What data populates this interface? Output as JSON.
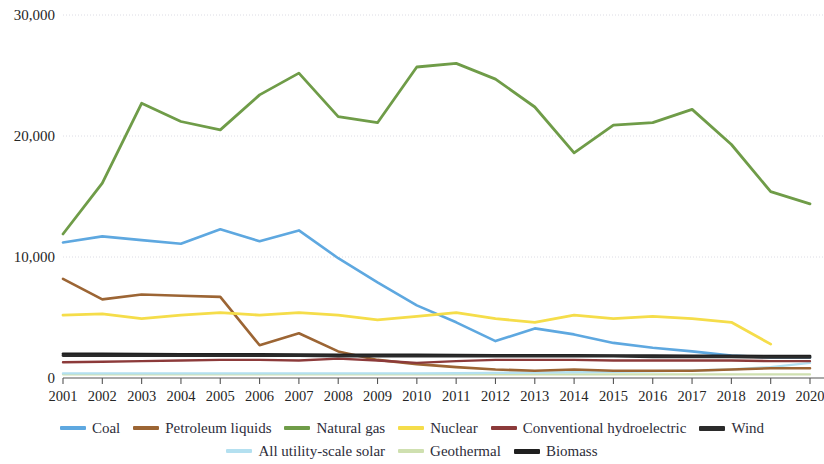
{
  "chart_data": {
    "type": "line",
    "title": "",
    "xlabel": "",
    "ylabel": "",
    "ylim": [
      0,
      30000
    ],
    "xlim": [
      "2001",
      "2020"
    ],
    "grid": true,
    "legend_position": "bottom",
    "y_ticks": [
      "0",
      "10,000",
      "20,000",
      "30,000"
    ],
    "y_tick_values": [
      0,
      10000,
      20000,
      30000
    ],
    "categories": [
      "2001",
      "2002",
      "2003",
      "2004",
      "2005",
      "2006",
      "2007",
      "2008",
      "2009",
      "2010",
      "2011",
      "2012",
      "2013",
      "2014",
      "2015",
      "2016",
      "2017",
      "2018",
      "2019",
      "2020"
    ],
    "series": [
      {
        "name": "Coal",
        "color": "#5ea8e0",
        "width": 2.6,
        "values": [
          11200,
          11700,
          11400,
          11100,
          12300,
          11300,
          12200,
          9900,
          7900,
          6000,
          4600,
          3050,
          4100,
          3600,
          2900,
          2500,
          2200,
          1850,
          1700,
          1700
        ]
      },
      {
        "name": "Petroleum liquids",
        "color": "#9c6534",
        "width": 2.6,
        "values": [
          8200,
          6500,
          6900,
          6800,
          6700,
          2700,
          3700,
          2200,
          1500,
          1150,
          900,
          700,
          600,
          700,
          600,
          600,
          600,
          700,
          800,
          800
        ]
      },
      {
        "name": "Natural gas",
        "color": "#6f9c48",
        "width": 2.8,
        "values": [
          11900,
          16100,
          22700,
          21200,
          20500,
          23400,
          25200,
          21600,
          21100,
          25700,
          26000,
          24700,
          22400,
          18600,
          20900,
          21100,
          22200,
          19300,
          15400,
          14400
        ]
      },
      {
        "name": "Nuclear",
        "color": "#f5dd4a",
        "width": 2.8,
        "values": [
          5200,
          5300,
          4900,
          5200,
          5400,
          5200,
          5400,
          5200,
          4800,
          5100,
          5400,
          4900,
          4600,
          5200,
          4900,
          5100,
          4900,
          4600,
          2800,
          null
        ]
      },
      {
        "name": "Conventional hydroelectric",
        "color": "#8c3a3a",
        "width": 2.4,
        "values": [
          1300,
          1350,
          1400,
          1450,
          1500,
          1500,
          1450,
          1600,
          1450,
          1250,
          1400,
          1500,
          1500,
          1500,
          1450,
          1450,
          1450,
          1450,
          1400,
          1400
        ]
      },
      {
        "name": "Wind",
        "color": "#2b2b2b",
        "width": 2.8,
        "values": [
          1850,
          1850,
          1850,
          1850,
          1850,
          1850,
          1850,
          1800,
          1800,
          1800,
          1800,
          1800,
          1800,
          1800,
          1800,
          1750,
          1750,
          1750,
          1700,
          1700
        ]
      },
      {
        "name": "All utility-scale solar",
        "color": "#b4e0f0",
        "width": 2.4,
        "values": [
          380,
          380,
          380,
          380,
          380,
          380,
          380,
          380,
          380,
          380,
          400,
          420,
          450,
          480,
          520,
          560,
          620,
          700,
          900,
          1250
        ]
      },
      {
        "name": "Geothermal",
        "color": "#cfe0b0",
        "width": 2.2,
        "values": [
          300,
          300,
          300,
          300,
          300,
          300,
          300,
          300,
          300,
          300,
          300,
          300,
          300,
          300,
          300,
          300,
          300,
          300,
          300,
          300
        ]
      },
      {
        "name": "Biomass",
        "color": "#1f1f1f",
        "width": 2.8,
        "values": [
          2000,
          1980,
          1970,
          1960,
          1950,
          1940,
          1930,
          1920,
          1910,
          1900,
          1890,
          1880,
          1870,
          1860,
          1850,
          1840,
          1830,
          1820,
          1810,
          1800
        ]
      }
    ],
    "legend": [
      {
        "label": "Coal",
        "color": "#5ea8e0",
        "thick": false
      },
      {
        "label": "Petroleum liquids",
        "color": "#9c6534",
        "thick": false
      },
      {
        "label": "Natural gas",
        "color": "#6f9c48",
        "thick": false
      },
      {
        "label": "Nuclear",
        "color": "#f5dd4a",
        "thick": false
      },
      {
        "label": "Conventional hydroelectric",
        "color": "#8c3a3a",
        "thick": false
      },
      {
        "label": "Wind",
        "color": "#2b2b2b",
        "thick": true
      },
      {
        "label": "All utility-scale solar",
        "color": "#b4e0f0",
        "thick": false
      },
      {
        "label": "Geothermal",
        "color": "#cfe0b0",
        "thick": false
      },
      {
        "label": "Biomass",
        "color": "#1f1f1f",
        "thick": true
      }
    ]
  },
  "axes": {
    "gridline_color": "#dcdce4",
    "axis_color": "#555555"
  }
}
